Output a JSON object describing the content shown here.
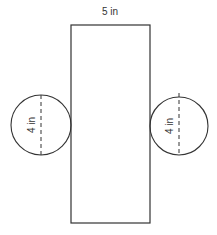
{
  "diagram": {
    "rectangle": {
      "width_label": "5 in",
      "x": 71,
      "y": 25,
      "w": 79,
      "h": 198
    },
    "circles": [
      {
        "id": "left",
        "diameter_label": "4 in",
        "cx": 41,
        "cy": 125,
        "r": 30
      },
      {
        "id": "right",
        "diameter_label": "4 in",
        "cx": 179,
        "cy": 126,
        "r": 29
      }
    ],
    "colors": {
      "stroke": "#333333",
      "background": "#ffffff"
    }
  }
}
